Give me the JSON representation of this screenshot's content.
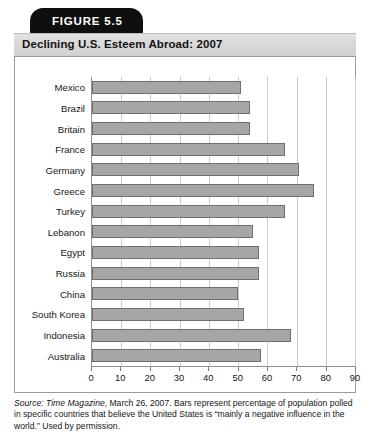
{
  "figure": {
    "tab_label": "FIGURE 5.5",
    "title": "Declining U.S. Esteem Abroad: 2007",
    "source_prefix": "Source:",
    "source_publication": "Time Magazine",
    "source_rest": ", March 26, 2007. Bars represent percentage of population polled in specific countries that believe the United States is “mainly a negative influence in the world.” Used by permission."
  },
  "colors": {
    "tab_background": "#100f0f",
    "tab_text": "#ffffff",
    "title_band": "#d9d9d9",
    "bar_fill": "#a6a6a6",
    "bar_stroke": "#6f6f6f",
    "gridline": "#cccccc",
    "axis": "#8f8f8f",
    "frame_border": "#9a9a9a",
    "page_background": "#ffffff",
    "text": "#161616"
  },
  "chart_data": {
    "type": "bar",
    "orientation": "horizontal",
    "title": "Declining U.S. Esteem Abroad: 2007",
    "xlabel": "",
    "ylabel": "",
    "xlim": [
      0,
      90
    ],
    "xticks": [
      0,
      10,
      20,
      30,
      40,
      50,
      60,
      70,
      80,
      90
    ],
    "grid": true,
    "legend": "none",
    "categories": [
      "Mexico",
      "Brazil",
      "Britain",
      "France",
      "Germany",
      "Greece",
      "Turkey",
      "Lebanon",
      "Egypt",
      "Russia",
      "China",
      "South Korea",
      "Indonesia",
      "Australia"
    ],
    "values": [
      51,
      54,
      54,
      66,
      71,
      76,
      66,
      55,
      57,
      57,
      50,
      52,
      68,
      58
    ],
    "series": [
      {
        "name": "Mainly a negative influence in the world (%)",
        "values": [
          51,
          54,
          54,
          66,
          71,
          76,
          66,
          55,
          57,
          57,
          50,
          52,
          68,
          58
        ]
      }
    ]
  }
}
